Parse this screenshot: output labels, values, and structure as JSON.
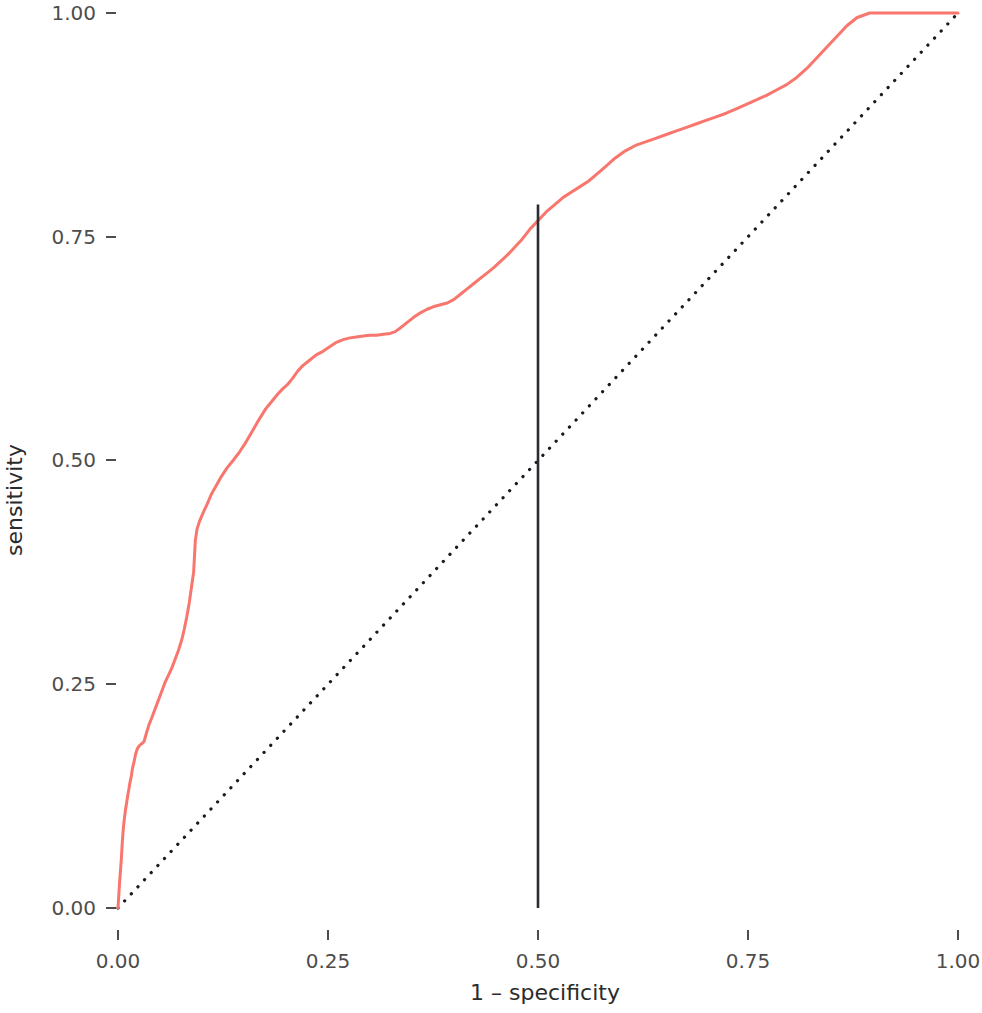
{
  "chart_data": {
    "type": "line",
    "title": "",
    "subtitle": "",
    "xlabel": "1 – specificity",
    "ylabel": "sensitivity",
    "xlim": [
      0,
      1
    ],
    "ylim": [
      0,
      1
    ],
    "grid": false,
    "legend": "none",
    "x_ticks": [
      0,
      0.25,
      0.5,
      0.75,
      1
    ],
    "x_tick_labels": [
      "0.00",
      "0.25",
      "0.50",
      "0.75",
      "1.00"
    ],
    "y_ticks": [
      0,
      0.25,
      0.5,
      0.75,
      1
    ],
    "y_tick_labels": [
      "0.00",
      "0.25",
      "0.50",
      "0.75",
      "1.00"
    ],
    "colors": {
      "roc_curve": "#F8766D",
      "chance_line": "#1A1A1A",
      "threshold_line": "#2B2B33",
      "axis_text": "#4D4D4D",
      "axis_title": "#2B2B2B",
      "background": "#FFFFFF"
    },
    "series": [
      {
        "name": "ROC curve",
        "type": "line",
        "color": "#F8766D",
        "linestyle": "solid",
        "x": [
          0.0,
          0.002,
          0.004,
          0.005,
          0.006,
          0.007,
          0.008,
          0.009,
          0.01,
          0.011,
          0.012,
          0.013,
          0.014,
          0.016,
          0.017,
          0.019,
          0.021,
          0.023,
          0.026,
          0.029,
          0.031,
          0.034,
          0.037,
          0.04,
          0.044,
          0.048,
          0.052,
          0.056,
          0.06,
          0.064,
          0.068,
          0.072,
          0.076,
          0.079,
          0.082,
          0.085,
          0.088,
          0.09,
          0.091,
          0.092,
          0.094,
          0.097,
          0.101,
          0.106,
          0.111,
          0.117,
          0.123,
          0.13,
          0.137,
          0.145,
          0.152,
          0.16,
          0.168,
          0.176,
          0.183,
          0.19,
          0.196,
          0.202,
          0.208,
          0.214,
          0.22,
          0.228,
          0.236,
          0.244,
          0.252,
          0.26,
          0.268,
          0.276,
          0.284,
          0.292,
          0.3,
          0.308,
          0.316,
          0.324,
          0.33,
          0.336,
          0.344,
          0.352,
          0.36,
          0.368,
          0.376,
          0.384,
          0.392,
          0.4,
          0.408,
          0.416,
          0.424,
          0.432,
          0.44,
          0.448,
          0.456,
          0.464,
          0.472,
          0.48,
          0.49,
          0.5,
          0.51,
          0.52,
          0.53,
          0.54,
          0.55,
          0.56,
          0.57,
          0.58,
          0.592,
          0.604,
          0.616,
          0.628,
          0.64,
          0.652,
          0.664,
          0.676,
          0.688,
          0.7,
          0.712,
          0.724,
          0.736,
          0.748,
          0.76,
          0.772,
          0.784,
          0.796,
          0.808,
          0.82,
          0.832,
          0.844,
          0.856,
          0.868,
          0.88,
          0.895,
          0.92,
          0.95,
          0.975,
          1.0
        ],
        "y": [
          0.0,
          0.03,
          0.055,
          0.072,
          0.085,
          0.095,
          0.103,
          0.11,
          0.116,
          0.122,
          0.128,
          0.133,
          0.139,
          0.148,
          0.155,
          0.163,
          0.172,
          0.178,
          0.182,
          0.184,
          0.186,
          0.196,
          0.205,
          0.212,
          0.222,
          0.232,
          0.242,
          0.252,
          0.26,
          0.268,
          0.278,
          0.288,
          0.3,
          0.312,
          0.326,
          0.342,
          0.362,
          0.375,
          0.392,
          0.41,
          0.423,
          0.432,
          0.441,
          0.451,
          0.462,
          0.472,
          0.482,
          0.492,
          0.5,
          0.51,
          0.52,
          0.533,
          0.546,
          0.558,
          0.566,
          0.574,
          0.58,
          0.585,
          0.592,
          0.6,
          0.606,
          0.612,
          0.618,
          0.622,
          0.627,
          0.632,
          0.635,
          0.637,
          0.638,
          0.639,
          0.64,
          0.64,
          0.641,
          0.642,
          0.644,
          0.648,
          0.654,
          0.66,
          0.665,
          0.669,
          0.672,
          0.674,
          0.676,
          0.68,
          0.686,
          0.692,
          0.698,
          0.704,
          0.71,
          0.716,
          0.723,
          0.73,
          0.738,
          0.746,
          0.758,
          0.768,
          0.778,
          0.786,
          0.794,
          0.8,
          0.806,
          0.812,
          0.82,
          0.828,
          0.838,
          0.846,
          0.852,
          0.856,
          0.86,
          0.864,
          0.868,
          0.872,
          0.876,
          0.88,
          0.884,
          0.888,
          0.893,
          0.898,
          0.903,
          0.908,
          0.914,
          0.92,
          0.928,
          0.938,
          0.95,
          0.962,
          0.974,
          0.986,
          0.995,
          1.0,
          1.0,
          1.0,
          1.0,
          1.0
        ]
      },
      {
        "name": "Chance line",
        "type": "line",
        "color": "#1A1A1A",
        "linestyle": "dotted",
        "x": [
          0,
          1
        ],
        "y": [
          0,
          1
        ]
      }
    ],
    "annotations": [
      {
        "name": "threshold-marker",
        "type": "vline",
        "x": 0.5,
        "y_start": 0.0,
        "y_end": 0.786,
        "color": "#2B2B33",
        "linestyle": "solid"
      }
    ]
  }
}
